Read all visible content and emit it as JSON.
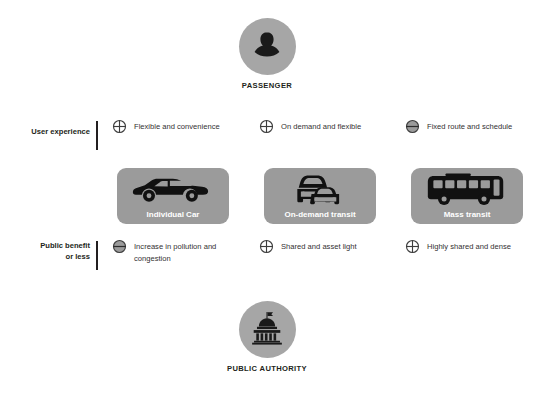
{
  "actors": {
    "top": {
      "id": "passenger",
      "caption": "PASSENGER",
      "icon": "person-silhouette-icon"
    },
    "bottom": {
      "id": "public-authority",
      "caption": "PUBLIC AUTHORITY",
      "icon": "government-building-icon"
    }
  },
  "rows": [
    {
      "id": "user-experience",
      "label": "User experience",
      "cells": [
        {
          "mark": "plus",
          "text": "Flexible and convenience"
        },
        {
          "mark": "plus",
          "text": "On demand and flexible"
        },
        {
          "mark": "minus",
          "text": "Fixed route and schedule"
        }
      ]
    },
    {
      "id": "public-benefit",
      "label": "Public benefit or less",
      "label_line1": "Public benefit",
      "label_line2": "or less",
      "cells": [
        {
          "mark": "minus",
          "text": "Increase in pollution and congestion"
        },
        {
          "mark": "plus",
          "text": "Shared and asset light"
        },
        {
          "mark": "plus",
          "text": "Highly shared and dense"
        }
      ]
    }
  ],
  "cards": [
    {
      "id": "individual-car",
      "label": "Individual Car",
      "icon": "car-side-icon"
    },
    {
      "id": "on-demand-transit",
      "label": "On-demand transit",
      "icon": "two-cars-front-icon"
    },
    {
      "id": "mass-transit",
      "label": "Mass transit",
      "icon": "bus-side-icon"
    }
  ],
  "colors": {
    "card_background": "#9b9b9b",
    "actor_circle": "#a6a6a6",
    "silhouette": "#1a1a1a",
    "text": "#231f20",
    "card_label": "#ffffff"
  }
}
